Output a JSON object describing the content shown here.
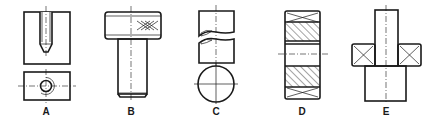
{
  "figure": {
    "type": "technical-drawing",
    "background": "#ffffff",
    "stroke_color": "#1a1a1a",
    "parts": [
      {
        "label": "A",
        "description": "Block with blind threaded hole: sectional front view with hatching and plan view with thread circle"
      },
      {
        "label": "B",
        "description": "Shouldered pin with knurled (cross-hatched XXX) head and chamfered shank end"
      },
      {
        "label": "C",
        "description": "Round shaft with break lines and hatched circular cross-section"
      },
      {
        "label": "D",
        "description": "Bush / ring in section with knurl crosses at ends and hatched walls"
      },
      {
        "label": "E",
        "description": "Stepped shaft with collar shown with diagonal cross (flat) marks"
      }
    ]
  }
}
